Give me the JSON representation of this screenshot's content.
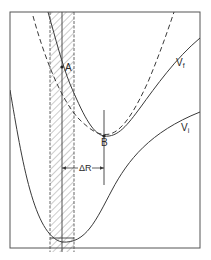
{
  "figure": {
    "type": "potential-energy-curve-diagram",
    "colors": {
      "line": "#3a3a3a",
      "hatch": "#8a8a8a",
      "background": "#ffffff"
    },
    "labels": {
      "point_a": "A",
      "point_b": "B",
      "delta_r": "ΔR",
      "curve_final": "V",
      "curve_final_sub": "f",
      "curve_initial": "V",
      "curve_initial_sub": "i"
    },
    "curves": [
      {
        "name": "V_f",
        "style": "solid",
        "description": "upper potential curve with minimum at B"
      },
      {
        "name": "V_f_shifted",
        "style": "dashed",
        "description": "dashed curve (shifted upper potential)"
      },
      {
        "name": "V_i",
        "style": "solid",
        "description": "lower potential curve with minimum at bottom of well"
      }
    ],
    "annotations": [
      {
        "id": "A",
        "description": "intersection of V_f with the center of hatched Franck-Condon band"
      },
      {
        "id": "B",
        "description": "minimum of V_f"
      },
      {
        "id": "delta_r",
        "description": "horizontal displacement between band center and B"
      }
    ]
  }
}
